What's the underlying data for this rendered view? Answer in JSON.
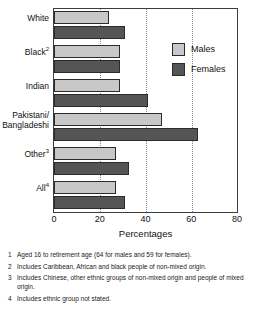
{
  "chart_data": {
    "type": "bar",
    "orientation": "horizontal",
    "title": "",
    "xlabel": "Percentages",
    "ylabel": "",
    "xlim": [
      0,
      80
    ],
    "xticks": [
      0,
      20,
      40,
      60,
      80
    ],
    "grid": true,
    "legend_position": "top-right",
    "categories": [
      "White",
      "Black",
      "Indian",
      "Pakistani/ Bangladeshi",
      "Other",
      "All"
    ],
    "category_footnote_markers": [
      "",
      "2",
      "",
      "",
      "3",
      "4"
    ],
    "series": [
      {
        "name": "Males",
        "values": [
          24,
          29,
          29,
          47,
          27,
          27
        ]
      },
      {
        "name": "Females",
        "values": [
          31,
          29,
          41,
          63,
          33,
          31
        ]
      }
    ]
  },
  "axis": {
    "x_title": "Percentages",
    "tick_labels": [
      "0",
      "20",
      "40",
      "60",
      "80"
    ]
  },
  "legend": {
    "items": [
      {
        "label": "Males"
      },
      {
        "label": "Females"
      }
    ]
  },
  "categories": [
    {
      "label": "White",
      "marker": ""
    },
    {
      "label": "Black",
      "marker": "2"
    },
    {
      "label": "Indian",
      "marker": ""
    },
    {
      "label": "Pakistani/",
      "label2": "Bangladeshi",
      "marker": ""
    },
    {
      "label": "Other",
      "marker": "3"
    },
    {
      "label": "All",
      "marker": "4"
    }
  ],
  "footnotes": [
    {
      "num": "1",
      "text": "Aged 16 to retirement age (64 for males and 59 for females)."
    },
    {
      "num": "2",
      "text": "Includes Caribbean, African and black people of non-mixed origin."
    },
    {
      "num": "3",
      "text": "Includes Chinese, other ethnic groups of non-mixed origin and people of mixed origin."
    },
    {
      "num": "4",
      "text": "Includes ethnic group not stated."
    }
  ],
  "colors": {
    "males": "#c8c8c8",
    "females": "#555555",
    "frame": "#3d3d3d",
    "grid": "#8a8a8a"
  }
}
